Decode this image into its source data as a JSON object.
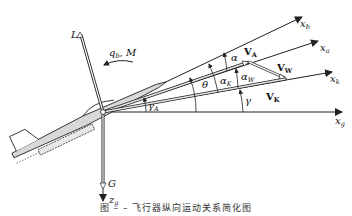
{
  "diagram": {
    "axes": {
      "x_b": "x_b",
      "x_a": "x_a",
      "x_k": "x_k",
      "x_g": "x_g",
      "z_g": "z_g"
    },
    "forces": {
      "lift": "L",
      "gravity": "G",
      "pitch_rate_moment": "q_b, M"
    },
    "vectors": {
      "airspeed": "V_A",
      "wind": "V_W",
      "ground_speed": "V_K"
    },
    "angles": {
      "alpha": "α",
      "alpha_W": "α_W",
      "alpha_K": "α_K",
      "theta": "θ",
      "gamma": "γ",
      "gamma_A": "γ_A"
    },
    "colors": {
      "line": "#222222",
      "aircraft_fill": "#d8d8d8",
      "vector_fill": "#e6e6e6"
    }
  },
  "caption": "图 – –  飞行器纵向运动关系简化图"
}
